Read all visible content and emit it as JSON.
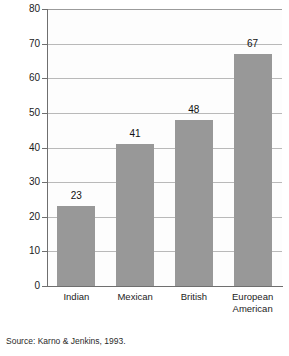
{
  "chart_data": {
    "type": "bar",
    "title": "",
    "subtitle": "",
    "xlabel": "",
    "ylabel": "Percent of families with high expressed emotion",
    "categories": [
      "Indian",
      "Mexican",
      "British",
      "European\nAmerican"
    ],
    "values": [
      23,
      41,
      48,
      67
    ],
    "value_labels": [
      "23",
      "41",
      "48",
      "67"
    ],
    "ylim": [
      0,
      80
    ],
    "ytick_values": [
      0,
      10,
      20,
      30,
      40,
      50,
      60,
      70,
      80
    ],
    "ytick_labels": [
      "0",
      "10",
      "20",
      "30",
      "40",
      "50",
      "60",
      "70",
      "80"
    ],
    "grid": "horizontal",
    "legend": "none",
    "series": [
      {
        "name": "Percent of families with high expressed emotion",
        "values": [
          23,
          41,
          48,
          67
        ]
      }
    ],
    "colors": {
      "bar_fill": "#989898",
      "gridline": "#b9b9b9",
      "axis": "#6f6f6f",
      "text": "#1c1c1c",
      "plot_background": "#fdfdfd",
      "page_background": "#ffffff"
    }
  },
  "source_note": "Source: Karno & Jenkins, 1993."
}
